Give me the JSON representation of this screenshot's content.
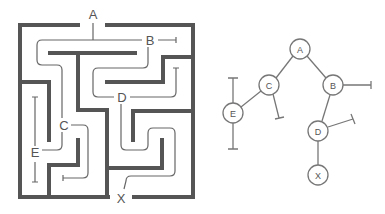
{
  "colors": {
    "background": "#ffffff",
    "wall": "#555555",
    "path": "#666666",
    "node_fill": "#ffffff",
    "node_stroke": "#777777",
    "label": "#555555"
  },
  "maze": {
    "labels": [
      {
        "id": "A",
        "text": "A",
        "x": 93,
        "y": 19
      },
      {
        "id": "B",
        "text": "B",
        "x": 150,
        "y": 45
      },
      {
        "id": "C",
        "text": "C",
        "x": 64,
        "y": 130
      },
      {
        "id": "D",
        "text": "D",
        "x": 122,
        "y": 102
      },
      {
        "id": "E",
        "text": "E",
        "x": 35,
        "y": 157
      },
      {
        "id": "X",
        "text": "X",
        "x": 121,
        "y": 203
      }
    ],
    "walls": [
      {
        "name": "outer-top-left",
        "d": "M20,25 L78,25"
      },
      {
        "name": "outer-top-right",
        "d": "M107,25 L193,25"
      },
      {
        "name": "outer-left",
        "d": "M20,25 L20,197"
      },
      {
        "name": "outer-right",
        "d": "M193,25 L193,197"
      },
      {
        "name": "outer-bottom-left",
        "d": "M20,197 L108,197"
      },
      {
        "name": "outer-bottom-right",
        "d": "M134,197 L193,197"
      },
      {
        "name": "wall-under-ab",
        "d": "M50,53 L135,53"
      },
      {
        "name": "wall-center-column",
        "d": "M78,53 L78,110 L107,110 L107,197"
      },
      {
        "name": "wall-right-upper",
        "d": "M107,82 L163,82 L163,57 L193,57"
      },
      {
        "name": "wall-left-upper",
        "d": "M20,82 L49,82 L49,140"
      },
      {
        "name": "wall-left-lower",
        "d": "M49,197 L49,165 L78,165 L78,140"
      },
      {
        "name": "wall-right-middle",
        "d": "M133,140 L133,111 L193,111"
      },
      {
        "name": "wall-right-lower",
        "d": "M107,168 L162,168 L162,140"
      }
    ],
    "paths": [
      {
        "name": "path-a-stem",
        "d": "M93,23 L93,40"
      },
      {
        "name": "path-a-to-b",
        "d": "M93,40 L142,40"
      },
      {
        "name": "path-b-deadend",
        "d": "M158,40 L176,40 M176,37 L176,43"
      },
      {
        "name": "path-a-to-c",
        "d": "M93,40 L42,40 Q37,40 37,45 L37,60 Q37,65 42,65 L57,65 Q62,65 62,70 L62,118"
      },
      {
        "name": "path-b-to-d",
        "d": "M148,47 L148,63 Q148,68 143,68 L98,68 Q93,68 93,73 L93,92 Q93,97 98,97 L114,97"
      },
      {
        "name": "path-d-deadend",
        "d": "M130,97 L171,97 Q176,97 176,92 L176,68 M173,68 L179,68"
      },
      {
        "name": "path-c-deadend",
        "d": "M71,125 L83,125 Q88,125 88,130 L88,173 Q88,178 83,178 L63,178 M63,175 L63,181"
      },
      {
        "name": "path-c-to-e",
        "d": "M62,132 L62,145 Q62,150 57,150 L42,150"
      },
      {
        "name": "path-e-up",
        "d": "M35,146 L35,97 M32,97 L38,97"
      },
      {
        "name": "path-e-down",
        "d": "M35,162 L35,182 M32,182 L38,182"
      },
      {
        "name": "path-d-to-x",
        "d": "M121,104 L121,145 Q121,150 126,150 L143,150 Q148,150 148,145 L148,133 Q148,128 153,128 L170,128 Q175,128 175,133 L175,171 Q175,176 170,176 L131,176 Q126,176 126,181 L124,189"
      }
    ]
  },
  "tree": {
    "node_radius": 10,
    "nodes": [
      {
        "id": "A",
        "label": "A",
        "x": 300,
        "y": 49
      },
      {
        "id": "C",
        "label": "C",
        "x": 269,
        "y": 85
      },
      {
        "id": "B",
        "label": "B",
        "x": 333,
        "y": 85
      },
      {
        "id": "E",
        "label": "E",
        "x": 233,
        "y": 113
      },
      {
        "id": "D",
        "label": "D",
        "x": 318,
        "y": 131
      },
      {
        "id": "X",
        "label": "X",
        "x": 318,
        "y": 175
      }
    ],
    "edges": [
      {
        "name": "edge-a-c",
        "d": "M293,56 L276,78"
      },
      {
        "name": "edge-a-b",
        "d": "M307,56 L326,78"
      },
      {
        "name": "edge-c-e",
        "d": "M261,91 L241,107"
      },
      {
        "name": "edge-b-d",
        "d": "M330,95 L322,121"
      },
      {
        "name": "edge-d-x",
        "d": "M318,141 L318,165"
      },
      {
        "name": "deadend-c",
        "d": "M273,94 L279,118 M275,119 L284,117"
      },
      {
        "name": "deadend-b",
        "d": "M343,85 L371,85 M371,81 L371,89"
      },
      {
        "name": "deadend-d",
        "d": "M328,127 L353,119 M351,114 L355,124"
      },
      {
        "name": "deadend-e-up",
        "d": "M233,103 L233,78 M228,78 L238,78"
      },
      {
        "name": "deadend-e-down",
        "d": "M233,123 L233,149 M228,149 L238,149"
      }
    ]
  }
}
